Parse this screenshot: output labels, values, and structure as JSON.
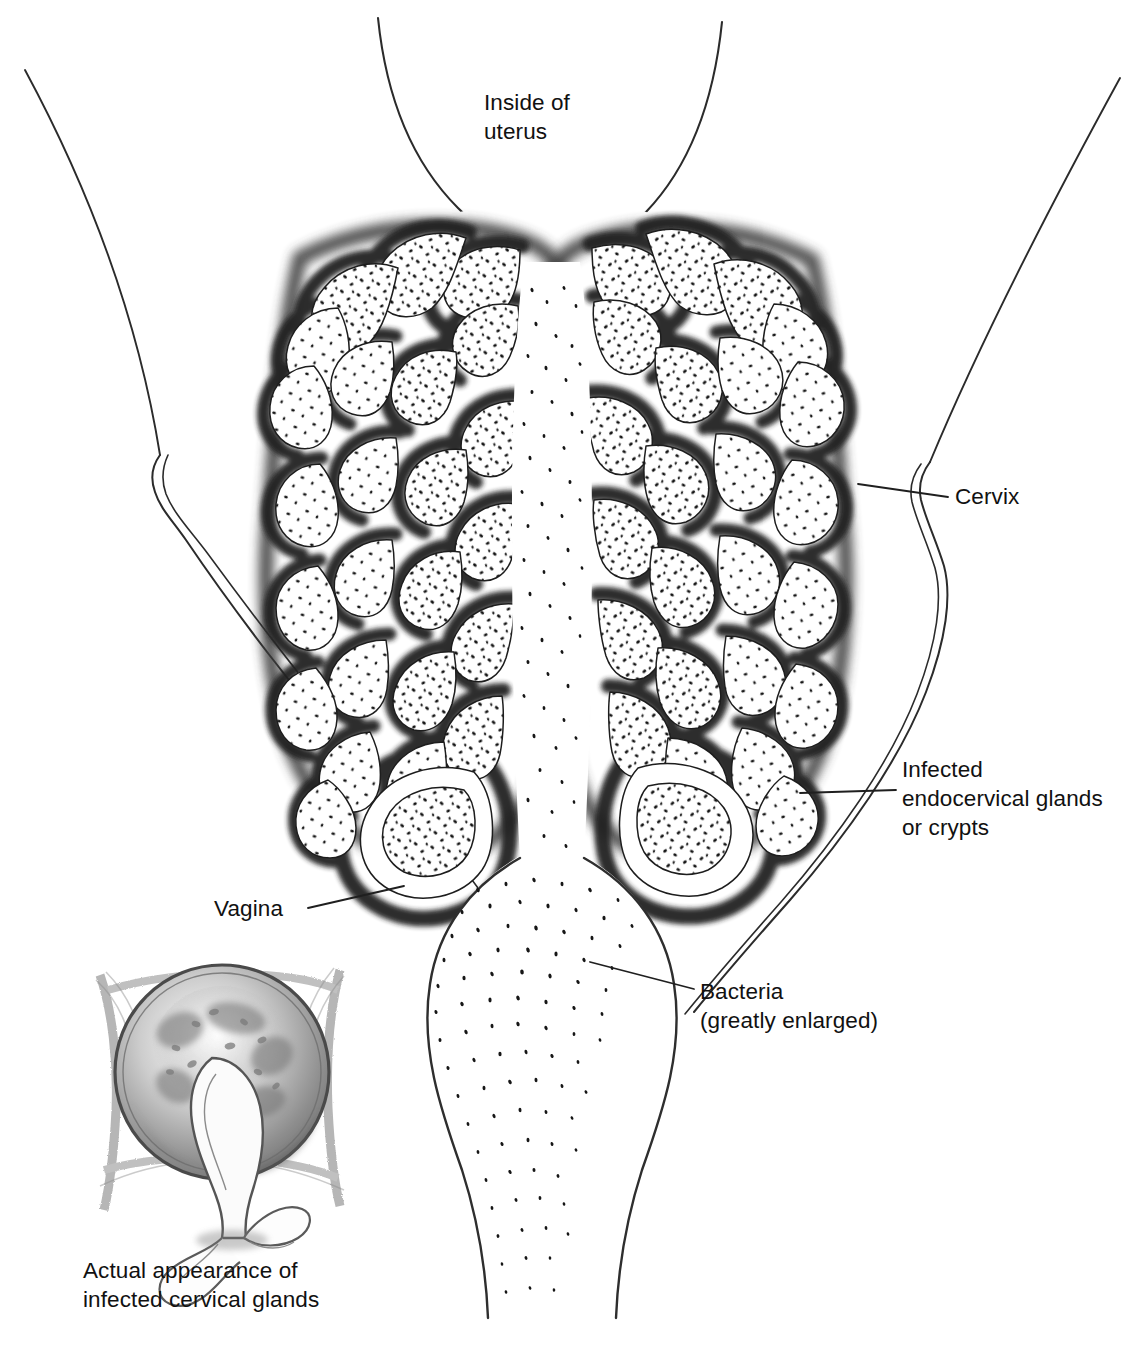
{
  "figure": {
    "background_color": "#ffffff",
    "ink_color": "#1a1a1a",
    "style": "pen-and-ink / pencil stipple medical illustration",
    "width": 1144,
    "height": 1345
  },
  "labels": {
    "uterus": "Inside of\nuterus",
    "cervix": "Cervix",
    "glands": "Infected\nendocervical glands\nor crypts",
    "bacteria": "Bacteria\n(greatly enlarged)",
    "vagina": "Vagina",
    "inset_caption": "Actual appearance of\ninfected cervical glands"
  },
  "structures": [
    {
      "name": "uterine-cavity",
      "description": "funnel-shaped cavity at top of figure narrowing into the cervical canal"
    },
    {
      "name": "cervix",
      "description": "large oval body containing branching endocervical glands on both sides of the canal"
    },
    {
      "name": "endocervical-glands",
      "description": "branching white crypts stippled with dark bacteria, outlined by smudged dark shading"
    },
    {
      "name": "cervical-canal",
      "description": "central vertical channel filled with streams of bacteria dots"
    },
    {
      "name": "vaginal-wall-left",
      "description": "thin curved line descending from upper left with a fold near the cervix"
    },
    {
      "name": "vaginal-wall-right",
      "description": "thin curved line descending from upper right with a fold near the cervix"
    },
    {
      "name": "inset-cervix",
      "description": "pencil-shaded frontal view of a cervix with discharge emerging from the os"
    }
  ],
  "leader_lines": [
    {
      "name": "cervix-leader",
      "from": "label Cervix",
      "to": "right cervical wall fold"
    },
    {
      "name": "glands-leader",
      "from": "label Infected endocervical glands or crypts",
      "to": "lower right gland cluster"
    },
    {
      "name": "bacteria-leader",
      "from": "label Bacteria (greatly enlarged)",
      "to": "center of cervical canal"
    },
    {
      "name": "vagina-leader",
      "from": "label Vagina",
      "to": "left vaginal wall beside the cervix"
    }
  ]
}
